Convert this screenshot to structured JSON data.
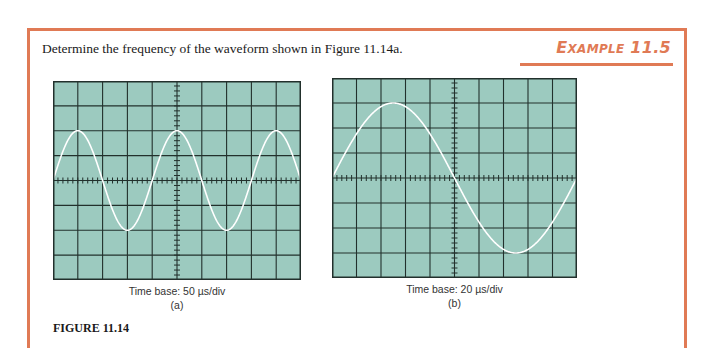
{
  "prompt": "Determine the frequency of the waveform shown in Figure 11.14a.",
  "example": {
    "first_letter": "E",
    "rest_small_caps": "XAMPLE",
    "number": "11.5",
    "color": "#e07a55"
  },
  "figure_label": "FIGURE 11.14",
  "colors": {
    "screen_bg": "#9ccabf",
    "grid": "#22302c",
    "trace": "#ffffff",
    "accent": "#e07a55"
  },
  "scopes": [
    {
      "id": "a",
      "caption": "Time base: 50 µs/div",
      "sublabel": "(a)",
      "x": 53,
      "y": 81,
      "width": 248,
      "height": 199,
      "h_divs": 10,
      "v_divs": 8
    },
    {
      "id": "b",
      "caption": "Time base: 20 µs/div",
      "sublabel": "(b)",
      "x": 332,
      "y": 78,
      "width": 245,
      "height": 200,
      "h_divs": 10,
      "v_divs": 8
    }
  ],
  "chart_data": [
    {
      "type": "line",
      "title": "Oscilloscope display (a)",
      "xlabel": "Time base: 50 µs/div",
      "ylabel": "",
      "grid": true,
      "xlim_divs": [
        0,
        10
      ],
      "ylim_divs": [
        -4,
        4
      ],
      "waveform": "sine",
      "start_phase_deg": 0,
      "period_divs": 4,
      "amplitude_divs": 2,
      "x_start_div": 0,
      "cycles_shown": 2.5,
      "time_per_div_us": 50,
      "period_us": 200,
      "frequency_khz": 5
    },
    {
      "type": "line",
      "title": "Oscilloscope display (b)",
      "xlabel": "Time base: 20 µs/div",
      "ylabel": "",
      "grid": true,
      "xlim_divs": [
        0,
        10
      ],
      "ylim_divs": [
        -4,
        4
      ],
      "waveform": "sine",
      "start_phase_deg": 0,
      "period_divs": 10,
      "amplitude_divs": 3,
      "x_start_div": 0,
      "cycles_shown": 1,
      "time_per_div_us": 20,
      "period_us": 200,
      "frequency_khz": 5
    }
  ]
}
